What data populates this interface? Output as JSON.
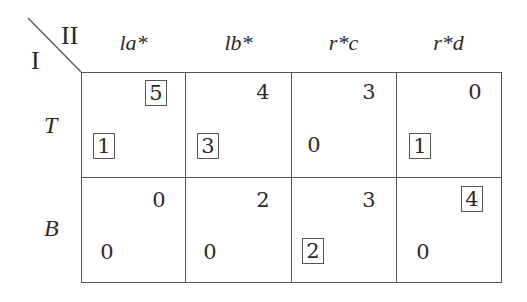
{
  "game": {
    "row_player": "I",
    "col_player": "II",
    "columns": [
      "la*",
      "lb*",
      "r*c",
      "r*d"
    ],
    "rows": [
      "T",
      "B"
    ],
    "cells": [
      [
        {
          "p1": "1",
          "p1_boxed": true,
          "p2": "5",
          "p2_boxed": true
        },
        {
          "p1": "3",
          "p1_boxed": true,
          "p2": "4",
          "p2_boxed": false
        },
        {
          "p1": "0",
          "p1_boxed": false,
          "p2": "3",
          "p2_boxed": false
        },
        {
          "p1": "1",
          "p1_boxed": true,
          "p2": "0",
          "p2_boxed": false
        }
      ],
      [
        {
          "p1": "0",
          "p1_boxed": false,
          "p2": "0",
          "p2_boxed": false
        },
        {
          "p1": "0",
          "p1_boxed": false,
          "p2": "2",
          "p2_boxed": false
        },
        {
          "p1": "2",
          "p1_boxed": true,
          "p2": "3",
          "p2_boxed": false
        },
        {
          "p1": "0",
          "p1_boxed": false,
          "p2": "4",
          "p2_boxed": true
        }
      ]
    ]
  }
}
